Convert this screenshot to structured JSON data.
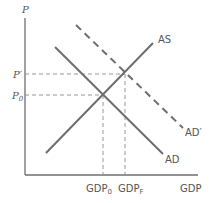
{
  "diagram": {
    "type": "aggregate-demand-aggregate-supply",
    "y_axis_label": "P",
    "x_axis_label": "GDP",
    "price_levels": [
      {
        "label": "P′",
        "main": "P",
        "sup": "′"
      },
      {
        "label": "P0",
        "main": "P",
        "sub": "0"
      }
    ],
    "gdp_levels": [
      {
        "label": "GDP0",
        "main": "GDP",
        "sub": "0"
      },
      {
        "label": "GDPF",
        "main": "GDP",
        "sub": "F"
      }
    ],
    "curves": [
      {
        "name": "AS",
        "label": "AS",
        "style": "solid"
      },
      {
        "name": "AD",
        "label": "AD",
        "style": "solid"
      },
      {
        "name": "AD′",
        "label": "AD′",
        "style": "dashed"
      }
    ],
    "colors": {
      "line": "#6e6e6e",
      "guide": "#8a8a8a",
      "text": "#555555"
    }
  }
}
